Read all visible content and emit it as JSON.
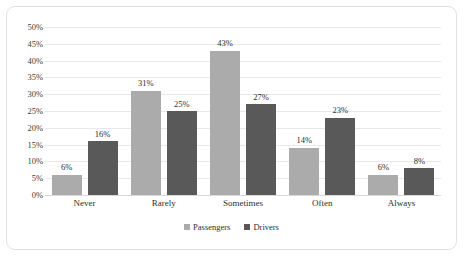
{
  "chart_data": {
    "type": "bar",
    "title": "",
    "subtitle": "",
    "xlabel": "",
    "ylabel": "",
    "categories": [
      "Never",
      "Rarely",
      "Sometimes",
      "Often",
      "Always"
    ],
    "series": [
      {
        "name": "Passengers",
        "color": "#ababab",
        "values": [
          6,
          31,
          43,
          14,
          6
        ]
      },
      {
        "name": "Drivers",
        "color": "#595959",
        "values": [
          16,
          25,
          27,
          23,
          8
        ]
      }
    ],
    "data_labels": [
      [
        "6%",
        "31%",
        "43%",
        "14%",
        "6%"
      ],
      [
        "16%",
        "25%",
        "27%",
        "23%",
        "8%"
      ]
    ],
    "ylim": [
      0,
      50
    ],
    "ytick_values": [
      0,
      5,
      10,
      15,
      20,
      25,
      30,
      35,
      40,
      45,
      50
    ],
    "ytick_labels": [
      "0%",
      "5%",
      "10%",
      "15%",
      "20%",
      "25%",
      "30%",
      "35%",
      "40%",
      "45%",
      "50%"
    ],
    "grid": true,
    "grid_color": "#e8e8e8",
    "legend_position": "bottom",
    "plot_background": "#ffffff",
    "frame_border_color": "#e2e2e2"
  }
}
